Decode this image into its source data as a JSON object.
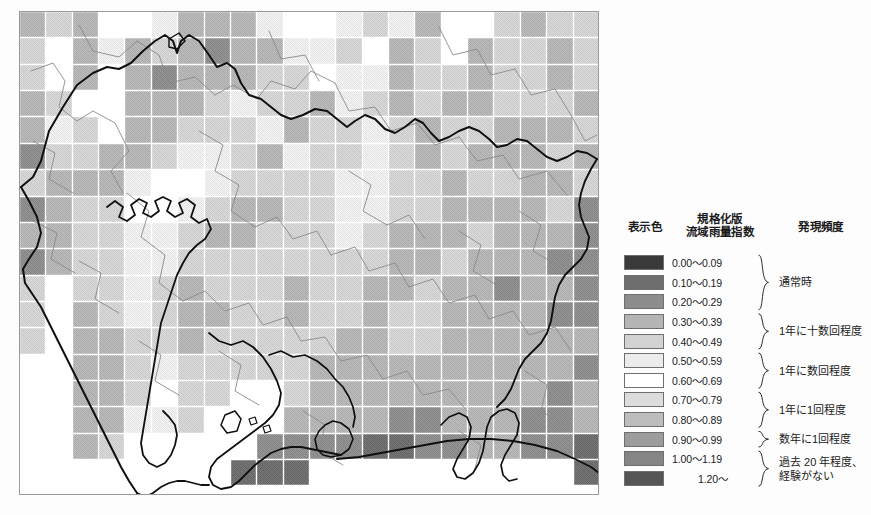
{
  "map": {
    "name": "normalized-basin-rainfall-index-map",
    "region": "Aichi / Gifu / Mie (Tokai region), Japan",
    "grid": {
      "cols": 22,
      "rows": 18,
      "cell_px": 26.36,
      "origin_x": 0,
      "origin_y": 0
    },
    "frame_color": "#9a9a9a",
    "gridline_color": "#ffffff",
    "prefecture_border_color": "#101010",
    "municipal_border_color": "#8a8a8a",
    "sea_color": "#ffffff"
  },
  "legend": {
    "headers": {
      "color": "表示色",
      "index_line1": "規格化版",
      "index_line2": "流域雨量指数",
      "frequency": "発現頻度"
    },
    "rows": [
      {
        "value": "0.00～0.09",
        "color": "#3a3a3a"
      },
      {
        "value": "0.10～0.19",
        "color": "#6e6e6e"
      },
      {
        "value": "0.20～0.29",
        "color": "#8d8d8d"
      },
      {
        "value": "0.30～0.39",
        "color": "#b4b4b4"
      },
      {
        "value": "0.40～0.49",
        "color": "#d2d2d2"
      },
      {
        "value": "0.50～0.59",
        "color": "#ececec"
      },
      {
        "value": "0.60～0.69",
        "color": "#ffffff"
      },
      {
        "value": "0.70～0.79",
        "color": "#dcdcdc"
      },
      {
        "value": "0.80～0.89",
        "color": "#bdbdbd"
      },
      {
        "value": "0.90～0.99",
        "color": "#9c9c9c"
      },
      {
        "value": "1.00～1.19",
        "color": "#858585"
      },
      {
        "value": "1.20～",
        "color": "#555555"
      }
    ],
    "frequency_groups": [
      {
        "label": "通常時",
        "from_row": 0,
        "to_row": 2
      },
      {
        "label": "1年に十数回程度",
        "from_row": 3,
        "to_row": 4
      },
      {
        "label": "1年に数回程度",
        "from_row": 5,
        "to_row": 6
      },
      {
        "label": "1年に1回程度",
        "from_row": 7,
        "to_row": 8
      },
      {
        "label": "数年に1回程度",
        "from_row": 9,
        "to_row": 9
      },
      {
        "label": "過去 20 年程度、経験がない",
        "from_row": 10,
        "to_row": 11
      }
    ]
  },
  "caption": {
    "text": ""
  },
  "chart_data": {
    "type": "heatmap",
    "xlabel": "",
    "ylabel": "",
    "legend_position": "right",
    "grid": true,
    "color_scale_labels": [
      "0.00～0.09",
      "0.10～0.19",
      "0.20～0.29",
      "0.30～0.39",
      "0.40～0.49",
      "0.50～0.59",
      "0.60～0.69",
      "0.70～0.79",
      "0.80～0.89",
      "0.90～0.99",
      "1.00～1.19",
      "1.20～"
    ],
    "color_scale_hex": [
      "#3a3a3a",
      "#6e6e6e",
      "#8d8d8d",
      "#b4b4b4",
      "#d2d2d2",
      "#ececec",
      "#ffffff",
      "#dcdcdc",
      "#bdbdbd",
      "#9c9c9c",
      "#858585",
      "#555555"
    ],
    "nodata_value": -1,
    "cells": [
      [
        3,
        4,
        3,
        6,
        6,
        5,
        3,
        3,
        3,
        5,
        6,
        6,
        5,
        4,
        5,
        3,
        6,
        6,
        4,
        3,
        4,
        4
      ],
      [
        4,
        6,
        3,
        5,
        3,
        4,
        3,
        2,
        3,
        3,
        5,
        5,
        4,
        6,
        3,
        4,
        6,
        3,
        4,
        4,
        3,
        4
      ],
      [
        4,
        6,
        3,
        6,
        3,
        2,
        3,
        3,
        3,
        4,
        4,
        6,
        5,
        5,
        3,
        4,
        4,
        3,
        4,
        4,
        3,
        4
      ],
      [
        3,
        4,
        6,
        6,
        3,
        3,
        3,
        4,
        5,
        4,
        4,
        3,
        5,
        4,
        3,
        4,
        3,
        3,
        4,
        4,
        4,
        3
      ],
      [
        3,
        5,
        4,
        6,
        3,
        3,
        4,
        4,
        4,
        5,
        3,
        4,
        4,
        5,
        4,
        3,
        4,
        4,
        3,
        3,
        3,
        4
      ],
      [
        2,
        4,
        4,
        3,
        3,
        4,
        5,
        5,
        4,
        3,
        5,
        4,
        4,
        5,
        4,
        3,
        4,
        3,
        3,
        3,
        4,
        3
      ],
      [
        4,
        3,
        3,
        3,
        5,
        6,
        6,
        5,
        4,
        4,
        4,
        4,
        5,
        5,
        4,
        4,
        3,
        4,
        4,
        3,
        3,
        4
      ],
      [
        2,
        3,
        4,
        4,
        6,
        6,
        5,
        4,
        3,
        3,
        4,
        4,
        5,
        5,
        4,
        4,
        3,
        3,
        3,
        3,
        4,
        2
      ],
      [
        3,
        3,
        4,
        4,
        5,
        5,
        4,
        3,
        3,
        4,
        4,
        4,
        5,
        4,
        3,
        3,
        3,
        4,
        3,
        3,
        3,
        2
      ],
      [
        2,
        3,
        4,
        4,
        5,
        5,
        4,
        4,
        4,
        4,
        4,
        4,
        4,
        4,
        3,
        3,
        4,
        3,
        3,
        3,
        2,
        2
      ],
      [
        4,
        -1,
        4,
        4,
        5,
        4,
        3,
        4,
        4,
        4,
        3,
        4,
        4,
        3,
        3,
        4,
        3,
        3,
        2,
        3,
        3,
        2
      ],
      [
        4,
        -1,
        3,
        4,
        5,
        4,
        3,
        3,
        4,
        4,
        3,
        4,
        4,
        3,
        4,
        4,
        3,
        3,
        3,
        3,
        2,
        2
      ],
      [
        4,
        -1,
        3,
        3,
        4,
        4,
        3,
        4,
        4,
        4,
        4,
        4,
        3,
        3,
        4,
        4,
        3,
        3,
        3,
        3,
        3,
        3
      ],
      [
        -1,
        -1,
        3,
        3,
        4,
        5,
        4,
        4,
        4,
        4,
        4,
        3,
        3,
        3,
        3,
        3,
        3,
        3,
        3,
        3,
        3,
        2
      ],
      [
        -1,
        -1,
        3,
        3,
        4,
        6,
        4,
        4,
        -1,
        -1,
        4,
        3,
        3,
        3,
        3,
        3,
        3,
        3,
        3,
        3,
        2,
        3
      ],
      [
        -1,
        -1,
        3,
        3,
        5,
        5,
        4,
        -1,
        -1,
        -1,
        3,
        3,
        3,
        3,
        2,
        2,
        3,
        3,
        3,
        2,
        2,
        3
      ],
      [
        -1,
        -1,
        3,
        4,
        -1,
        -1,
        -1,
        -1,
        -1,
        2,
        2,
        2,
        2,
        1,
        1,
        2,
        2,
        3,
        3,
        2,
        2,
        1
      ],
      [
        -1,
        -1,
        -1,
        -1,
        -1,
        -1,
        -1,
        -1,
        1,
        1,
        1,
        -1,
        -1,
        -1,
        -1,
        -1,
        -1,
        -1,
        -1,
        -1,
        -1,
        1
      ]
    ]
  }
}
